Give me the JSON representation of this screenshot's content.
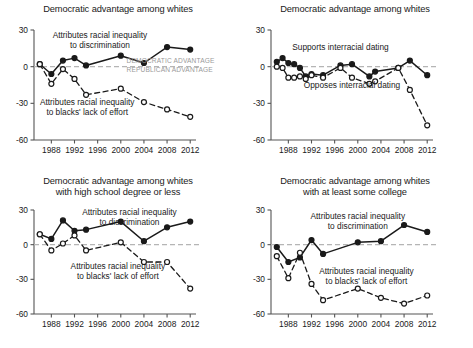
{
  "figure": {
    "background_color": "#ffffff",
    "line_color": "#1a1a1a",
    "zero_line_color": "#b5b5b5",
    "gray_label_color": "#9a9a9a"
  },
  "chart_data": [
    {
      "panel": "top-left",
      "type": "line",
      "title": "Democratic advantage among whites",
      "xlabel": "",
      "ylabel": "",
      "xlim": [
        1985,
        2013
      ],
      "ylim": [
        -60,
        30
      ],
      "yticks": [
        30,
        0,
        -30,
        -60
      ],
      "ytick_labels": [
        "30",
        "0",
        "-30",
        "-60"
      ],
      "xticks": [
        1988,
        1992,
        1996,
        2000,
        2004,
        2008,
        2012
      ],
      "xtick_labels": [
        "1988",
        "1992",
        "1996",
        "2000",
        "2004",
        "2008",
        "2012"
      ],
      "grid": false,
      "zero_reference_line": true,
      "legend_position": "inline-annotation",
      "annotations": [
        {
          "text": "Attributes racial inequality\nto discrimination",
          "x": 1996.4,
          "y": 23.5
        },
        {
          "text": "Attributes racial inequality\nto blacks' lack of effort",
          "x": 1994.2,
          "y": -31.5
        },
        {
          "text": "DEMOCRATIC ADVANTAGE",
          "x": 2001.0,
          "y": 3.2,
          "style": "gray-caps"
        },
        {
          "text": "REPUBLICAN ADVANTAGE",
          "x": 2001.0,
          "y": -4.2,
          "style": "gray-caps"
        }
      ],
      "series": [
        {
          "name": "Attributes racial inequality to discrimination",
          "style": "solid-filled-circle",
          "x": [
            1986,
            1988,
            1990,
            1992,
            1994,
            2000,
            2004,
            2008,
            2012
          ],
          "values": [
            2,
            -6,
            5,
            7,
            1,
            9,
            3,
            16,
            14
          ]
        },
        {
          "name": "Attributes racial inequality to blacks' lack of effort",
          "style": "dashed-open-circle",
          "x": [
            1986,
            1988,
            1990,
            1992,
            1994,
            2000,
            2004,
            2008,
            2012
          ],
          "values": [
            2,
            -14,
            -2,
            -10,
            -23,
            -18,
            -29,
            -35,
            -41
          ]
        }
      ]
    },
    {
      "panel": "top-right",
      "type": "line",
      "title": "Democratic advantage among whites",
      "xlabel": "",
      "ylabel": "",
      "xlim": [
        1985,
        2013
      ],
      "ylim": [
        -60,
        30
      ],
      "yticks": [
        30,
        0,
        -30,
        -60
      ],
      "ytick_labels": [
        "30",
        "0",
        "-30",
        "-60"
      ],
      "xticks": [
        1988,
        1992,
        1996,
        2000,
        2004,
        2008,
        2012
      ],
      "xtick_labels": [
        "1988",
        "1992",
        "1996",
        "2000",
        "2004",
        "2008",
        "2012"
      ],
      "grid": false,
      "zero_reference_line": true,
      "legend_position": "inline-annotation",
      "annotations": [
        {
          "text": "Supports interracial dating",
          "x": 1997.0,
          "y": 14.0
        },
        {
          "text": "Opposes interracial dating",
          "x": 1999.0,
          "y": -17.5
        }
      ],
      "series": [
        {
          "name": "Supports interracial dating",
          "style": "solid-filled-circle",
          "x": [
            1986,
            1987,
            1988,
            1989,
            1990,
            1991,
            1992,
            1994,
            1997,
            1999,
            2002,
            2003,
            2007,
            2009,
            2012
          ],
          "values": [
            4,
            7,
            3,
            2,
            -1,
            -8,
            -6,
            -7,
            1,
            2,
            -8,
            -4,
            -1,
            5,
            -7
          ]
        },
        {
          "name": "Opposes interracial dating",
          "style": "dashed-open-circle",
          "x": [
            1986,
            1987,
            1988,
            1989,
            1990,
            1991,
            1992,
            1994,
            1997,
            1999,
            2002,
            2003,
            2007,
            2009,
            2012
          ],
          "values": [
            0,
            -1,
            -9,
            -9,
            -8,
            -10,
            -7,
            -9,
            -1,
            -9,
            -14,
            -12,
            -1,
            -19,
            -48
          ]
        }
      ]
    },
    {
      "panel": "bottom-left",
      "type": "line",
      "title": "Democratic advantage among whites\nwith high school degree or less",
      "xlabel": "",
      "ylabel": "",
      "xlim": [
        1985,
        2013
      ],
      "ylim": [
        -60,
        30
      ],
      "yticks": [
        30,
        0,
        -30,
        -60
      ],
      "ytick_labels": [
        "30",
        "0",
        "-30",
        "-60"
      ],
      "xticks": [
        1988,
        1992,
        1996,
        2000,
        2004,
        2008,
        2012
      ],
      "xtick_labels": [
        "1988",
        "1992",
        "1996",
        "2000",
        "2004",
        "2008",
        "2012"
      ],
      "grid": false,
      "zero_reference_line": true,
      "legend_position": "inline-annotation",
      "annotations": [
        {
          "text": "Attributes racial inequality\nto discrimination",
          "x": 2001.5,
          "y": 26.0
        },
        {
          "text": "Attributes racial inequality\nto blacks' lack of effort",
          "x": 1999.5,
          "y": -21.0
        }
      ],
      "series": [
        {
          "name": "Attributes racial inequality to discrimination",
          "style": "solid-filled-circle",
          "x": [
            1986,
            1988,
            1990,
            1992,
            1994,
            2000,
            2004,
            2008,
            2012
          ],
          "values": [
            9,
            5,
            21,
            12,
            13,
            20,
            3,
            15,
            20
          ]
        },
        {
          "name": "Attributes racial inequality to blacks' lack of effort",
          "style": "dashed-open-circle",
          "x": [
            1986,
            1988,
            1990,
            1992,
            1994,
            2000,
            2004,
            2008,
            2012
          ],
          "values": [
            9,
            -5,
            1,
            8,
            -5,
            2,
            -15,
            -15,
            -38
          ]
        }
      ]
    },
    {
      "panel": "bottom-right",
      "type": "line",
      "title": "Democratic advantage among whites\nwith at least some college",
      "xlabel": "",
      "ylabel": "",
      "xlim": [
        1985,
        2013
      ],
      "ylim": [
        -60,
        30
      ],
      "yticks": [
        30,
        0,
        -30,
        -60
      ],
      "ytick_labels": [
        "30",
        "0",
        "-30",
        "-60"
      ],
      "xticks": [
        1988,
        1992,
        1996,
        2000,
        2004,
        2008,
        2012
      ],
      "xtick_labels": [
        "1988",
        "1992",
        "1996",
        "2000",
        "2004",
        "2008",
        "2012"
      ],
      "grid": false,
      "zero_reference_line": true,
      "legend_position": "inline-annotation",
      "annotations": [
        {
          "text": "Attributes racial inequality\nto discrimination",
          "x": 2000.0,
          "y": 22.0
        },
        {
          "text": "Attributes racial inequality\nto blacks' lack of effort",
          "x": 2001.5,
          "y": -25.0
        }
      ],
      "series": [
        {
          "name": "Attributes racial inequality to discrimination",
          "style": "solid-filled-circle",
          "x": [
            1986,
            1988,
            1990,
            1992,
            1994,
            2000,
            2004,
            2008,
            2012
          ],
          "values": [
            -2,
            -15,
            -11,
            4,
            -8,
            2,
            3,
            17,
            11
          ]
        },
        {
          "name": "Attributes racial inequality to blacks' lack of effort",
          "style": "dashed-open-circle",
          "x": [
            1986,
            1988,
            1990,
            1992,
            1994,
            2000,
            2004,
            2008,
            2012
          ],
          "values": [
            -10,
            -29,
            -7,
            -34,
            -48,
            -38,
            -46,
            -51,
            -44
          ]
        }
      ]
    }
  ]
}
